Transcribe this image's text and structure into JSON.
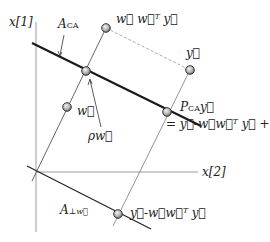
{
  "axes": {
    "vertical_label": "x[1]",
    "horizontal_label": "x[2]"
  },
  "lines": {
    "constraint_affine": "A_CA",
    "orthogonal_complement": "A_⊥w"
  },
  "points": {
    "w": "w⃗",
    "w_wT_y": "w⃗ w⃗ᵀ y⃗",
    "y": "y⃗",
    "rho_w": "ρw⃗",
    "p_ca_y": "P_CA y⃗",
    "p_ca_y_formula": "= y⃗-w⃗w⃗ᵀ y⃗ + ρw⃗",
    "y_minus_wwTy": "y⃗-w⃗w⃗ᵀ y⃗"
  },
  "colors": {
    "axis": "#9a9a9a",
    "thick_line": "#1a1a1a",
    "thin_line": "#777777",
    "dashed": "#aaaaaa",
    "node_ring": "#333333"
  }
}
